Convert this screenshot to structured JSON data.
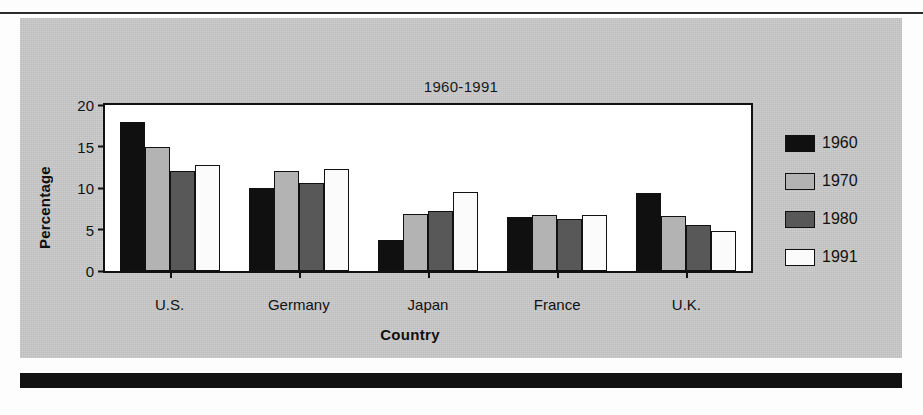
{
  "chart_data": {
    "type": "bar",
    "title": "1960-1991",
    "xlabel": "Country",
    "ylabel": "Percentage",
    "categories": [
      "U.S.",
      "Germany",
      "Japan",
      "France",
      "U.K."
    ],
    "series": [
      {
        "name": "1960",
        "color": "#101010",
        "values": [
          18.0,
          10.0,
          3.7,
          6.5,
          9.4
        ]
      },
      {
        "name": "1970",
        "color": "#b3b3b3",
        "values": [
          15.0,
          12.1,
          6.9,
          6.7,
          6.6
        ]
      },
      {
        "name": "1980",
        "color": "#585858",
        "values": [
          12.1,
          10.6,
          7.2,
          6.3,
          5.5
        ]
      },
      {
        "name": "1991",
        "color": "#fbfbfb",
        "values": [
          12.8,
          12.3,
          9.5,
          6.7,
          4.8
        ]
      }
    ],
    "ylim": [
      0,
      20
    ],
    "yticks": [
      0,
      5,
      10,
      15,
      20
    ],
    "ytick_labels": [
      "0",
      "5",
      "10",
      "15",
      "20"
    ],
    "grid": false,
    "legend_position": "right"
  }
}
